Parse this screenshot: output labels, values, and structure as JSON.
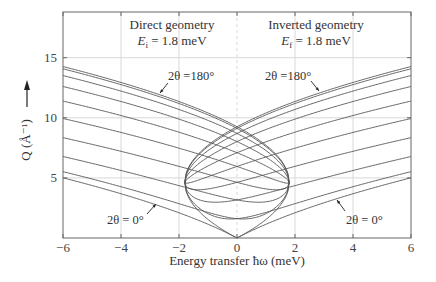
{
  "chart_data": {
    "type": "line",
    "title": "",
    "xlabel": "Energy transfer ħω (meV)",
    "ylabel": "Q (Å⁻¹)",
    "xlim": [
      -6,
      6
    ],
    "ylim": [
      0,
      18.8
    ],
    "xticks": [
      -6,
      -4,
      -2,
      0,
      2,
      4,
      6
    ],
    "xtick_labels": [
      "−6",
      "−4",
      "−2",
      "0",
      "2",
      "4",
      "6"
    ],
    "yticks": [
      5,
      10,
      15
    ],
    "ytick_labels": [
      "5",
      "10",
      "15"
    ],
    "grid": true,
    "zero_line_dashed": true,
    "k_constant": 3.45,
    "scattering_angles_deg": [
      0,
      20,
      40,
      60,
      80,
      100,
      120,
      140,
      160,
      180
    ],
    "panels": [
      {
        "name": "Direct geometry",
        "label_line1": "Direct geometry",
        "label_var": "E",
        "label_sub": "i",
        "label_value": " = 1.8 meV",
        "fixed": "Ei",
        "E_fixed": 1.8,
        "x_range": [
          -6,
          1.8
        ]
      },
      {
        "name": "Inverted geometry",
        "label_line1": "Inverted geometry",
        "label_var": "E",
        "label_sub": "f",
        "label_value": " = 1.8 meV",
        "fixed": "Ef",
        "E_fixed": 1.8,
        "x_range": [
          -1.8,
          6
        ]
      }
    ],
    "series": [
      {
        "name": "Direct 2θ=0°",
        "x": [
          -6,
          -4,
          -2,
          0
        ],
        "y": [
          5.0,
          3.7,
          2.1,
          0.0
        ]
      },
      {
        "name": "Direct 2θ=180°",
        "x": [
          -6,
          -4,
          -2,
          0,
          1.8
        ],
        "y": [
          14.3,
          12.9,
          11.4,
          9.3,
          4.6
        ]
      },
      {
        "name": "Inverted 2θ=0°",
        "x": [
          0,
          2,
          4,
          6
        ],
        "y": [
          0.0,
          2.1,
          3.7,
          5.0
        ]
      },
      {
        "name": "Inverted 2θ=180°",
        "x": [
          -1.8,
          0,
          2,
          4,
          6
        ],
        "y": [
          4.6,
          9.3,
          11.4,
          12.9,
          14.3
        ]
      }
    ],
    "annotations": [
      {
        "text": "2θ =180°",
        "panel": "direct",
        "tx": 168,
        "ty": 80,
        "ax1": 168,
        "ay1": 83,
        "ax2": 160,
        "ay2": 93
      },
      {
        "text": "2θ =180°",
        "panel": "inverted",
        "tx": 265,
        "ty": 80,
        "ax1": 311,
        "ay1": 81,
        "ax2": 319,
        "ay2": 91
      },
      {
        "text": "2θ = 0°",
        "panel": "direct",
        "tx": 107,
        "ty": 224,
        "ax1": 147,
        "ay1": 214,
        "ax2": 156,
        "ay2": 204
      },
      {
        "text": "2θ = 0°",
        "panel": "inverted",
        "tx": 346,
        "ty": 224,
        "ax1": 345,
        "ay1": 211,
        "ax2": 337,
        "ay2": 200
      }
    ],
    "colors": {
      "curve": "#555555",
      "grid": "#d8d8d8",
      "frame": "#666666",
      "text": "#333333"
    }
  }
}
